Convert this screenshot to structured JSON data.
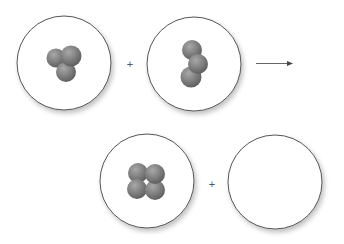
{
  "diagram": {
    "type": "chemical-reaction-molecular-view",
    "operators": {
      "plus": "+",
      "arrow": "→"
    },
    "reactants": [
      {
        "id": "box-1",
        "molecule": "3-atom cluster (trigonal)",
        "atoms": 3
      },
      {
        "id": "box-2",
        "molecule": "3-atom chain (bent)",
        "atoms": 3
      }
    ],
    "products": [
      {
        "id": "box-3",
        "molecule": "4-atom cluster (square)",
        "atoms": 4
      },
      {
        "id": "box-4",
        "molecule": "empty",
        "atoms": 0
      }
    ],
    "colors": {
      "atom": "#808080",
      "circle_stroke": "#555555",
      "background": "#ffffff"
    }
  }
}
